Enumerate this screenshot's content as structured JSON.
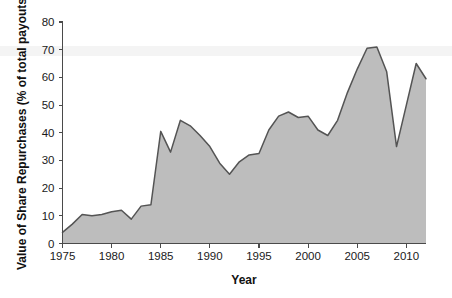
{
  "chart_data": {
    "type": "area",
    "title": "",
    "xlabel": "Year",
    "ylabel": "Value of Share Repurchases (% of total payouts)",
    "xlim": [
      1975,
      2012
    ],
    "ylim": [
      0,
      80
    ],
    "xticks": [
      1975,
      1980,
      1985,
      1990,
      1995,
      2000,
      2005,
      2010
    ],
    "xtick_labels": [
      "1975",
      "1980",
      "1985",
      "1990",
      "1995",
      "2000",
      "2005",
      "2010"
    ],
    "yticks": [
      0,
      10,
      20,
      30,
      40,
      50,
      60,
      70,
      80
    ],
    "ytick_labels": [
      "0",
      "10",
      "20",
      "30",
      "40",
      "50",
      "60",
      "70",
      "80"
    ],
    "grid": false,
    "legend": null,
    "fill_color": "#bdbdbd",
    "line_color": "#545454",
    "x": [
      1975,
      1976,
      1977,
      1978,
      1979,
      1980,
      1981,
      1982,
      1983,
      1984,
      1985,
      1986,
      1987,
      1988,
      1989,
      1990,
      1991,
      1992,
      1993,
      1994,
      1995,
      1996,
      1997,
      1998,
      1999,
      2000,
      2001,
      2002,
      2003,
      2004,
      2005,
      2006,
      2007,
      2008,
      2009,
      2010,
      2011,
      2012
    ],
    "values": [
      4.0,
      7.0,
      10.5,
      10.0,
      10.5,
      11.5,
      12.0,
      8.8,
      13.5,
      14.0,
      40.5,
      33.0,
      44.5,
      42.5,
      39.0,
      35.0,
      29.0,
      25.0,
      29.5,
      32.0,
      32.5,
      41.0,
      46.0,
      47.5,
      45.5,
      46.0,
      41.0,
      39.0,
      44.5,
      54.5,
      63.0,
      70.5,
      71.0,
      62.0,
      35.0,
      50.0,
      65.0,
      59.5
    ],
    "series_name": "Value of Share Repurchases"
  },
  "axis": {
    "x_title": "Year",
    "y_title": "Value of Share Repurchases (% of total payouts)"
  }
}
